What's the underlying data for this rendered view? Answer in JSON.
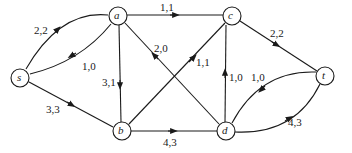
{
  "diagram": {
    "type": "flow-network",
    "nodes": [
      {
        "id": "s",
        "label": "s",
        "x": 20,
        "y": 78
      },
      {
        "id": "a",
        "label": "a",
        "x": 118,
        "y": 16
      },
      {
        "id": "c",
        "label": "c",
        "x": 232,
        "y": 16
      },
      {
        "id": "t",
        "label": "t",
        "x": 325,
        "y": 76
      },
      {
        "id": "b",
        "label": "b",
        "x": 122,
        "y": 131
      },
      {
        "id": "d",
        "label": "d",
        "x": 226,
        "y": 131
      }
    ],
    "edges": [
      {
        "from": "s",
        "to": "a",
        "label": "2,2"
      },
      {
        "from": "a",
        "to": "s",
        "label": "1,0"
      },
      {
        "from": "a",
        "to": "c",
        "label": "1,1"
      },
      {
        "from": "a",
        "to": "b",
        "label": "3,1"
      },
      {
        "from": "d",
        "to": "a",
        "label": "2,0"
      },
      {
        "from": "b",
        "to": "c",
        "label": "1,1"
      },
      {
        "from": "s",
        "to": "b",
        "label": "3,3"
      },
      {
        "from": "b",
        "to": "d",
        "label": "4,3"
      },
      {
        "from": "d",
        "to": "c",
        "label": "1,0"
      },
      {
        "from": "c",
        "to": "t",
        "label": "2,2"
      },
      {
        "from": "t",
        "to": "d",
        "label": "1,0"
      },
      {
        "from": "d",
        "to": "t",
        "label": "4,3"
      }
    ]
  }
}
